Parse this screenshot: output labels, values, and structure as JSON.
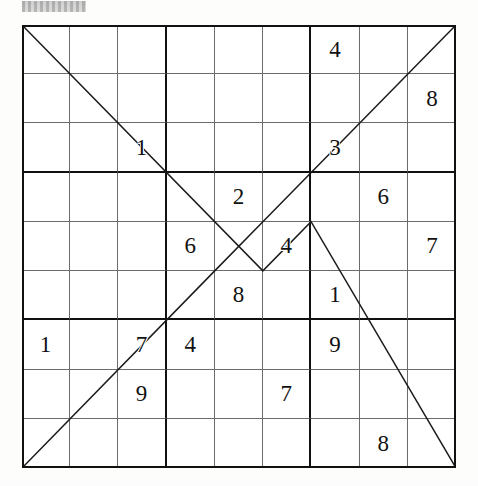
{
  "document": {
    "type": "sudoku-puzzle",
    "title": "Sudoku Puzzle Grid",
    "header_artifact": "gray-smudge",
    "grid_size": 9,
    "box_size": 3,
    "ink_color": "#111111",
    "thin_line_color": "#6b6b6b",
    "thick_line_color": "#111111",
    "background_color": "#ffffff"
  },
  "puzzle": {
    "variant": "diagonal-zigzag-sudoku",
    "row_labels": [
      "R1",
      "R2",
      "R3",
      "R4",
      "R5",
      "R6",
      "R7",
      "R8",
      "R9"
    ],
    "column_labels": [
      "C1",
      "C2",
      "C3",
      "C4",
      "C5",
      "C6",
      "C7",
      "C8",
      "C9"
    ],
    "given_count": 18,
    "empty_cell_text": "",
    "rows": [
      [
        "",
        "",
        "",
        "",
        "",
        "",
        "4",
        "",
        ""
      ],
      [
        "",
        "",
        "",
        "",
        "",
        "",
        "",
        "",
        "8"
      ],
      [
        "",
        "",
        "1",
        "",
        "",
        "",
        "3",
        "",
        ""
      ],
      [
        "",
        "",
        "",
        "",
        "2",
        "",
        "",
        "6",
        ""
      ],
      [
        "",
        "",
        "",
        "6",
        "",
        "4",
        "",
        "",
        "7"
      ],
      [
        "",
        "",
        "",
        "",
        "8",
        "",
        "1",
        "",
        ""
      ],
      [
        "1",
        "",
        "7",
        "4",
        "",
        "",
        "9",
        "",
        ""
      ],
      [
        "",
        "",
        "9",
        "",
        "",
        "7",
        "",
        "",
        ""
      ],
      [
        "",
        "",
        "",
        "",
        "",
        "",
        "",
        "8",
        ""
      ]
    ],
    "givens": [
      {
        "row": 1,
        "col": 7,
        "value": "4"
      },
      {
        "row": 2,
        "col": 9,
        "value": "8"
      },
      {
        "row": 3,
        "col": 3,
        "value": "1"
      },
      {
        "row": 3,
        "col": 7,
        "value": "3"
      },
      {
        "row": 4,
        "col": 5,
        "value": "2"
      },
      {
        "row": 4,
        "col": 8,
        "value": "6"
      },
      {
        "row": 5,
        "col": 4,
        "value": "6"
      },
      {
        "row": 5,
        "col": 6,
        "value": "4"
      },
      {
        "row": 5,
        "col": 9,
        "value": "7"
      },
      {
        "row": 6,
        "col": 5,
        "value": "8"
      },
      {
        "row": 6,
        "col": 7,
        "value": "1"
      },
      {
        "row": 7,
        "col": 1,
        "value": "1"
      },
      {
        "row": 7,
        "col": 3,
        "value": "7"
      },
      {
        "row": 7,
        "col": 4,
        "value": "4"
      },
      {
        "row": 7,
        "col": 7,
        "value": "9"
      },
      {
        "row": 8,
        "col": 3,
        "value": "9"
      },
      {
        "row": 8,
        "col": 6,
        "value": "7"
      },
      {
        "row": 9,
        "col": 8,
        "value": "8"
      }
    ]
  },
  "diagonals": {
    "description": "Two bouncing diagonal paths drawn across the grid forming crossing X shapes",
    "stroke_color": "#1b1b1b",
    "stroke_width": 1.5,
    "paths": [
      {
        "name": "descending-bouncing-diagonal",
        "points_percent": [
          [
            0,
            0
          ],
          [
            55.5,
            55.5
          ],
          [
            66.6,
            44.4
          ],
          [
            100,
            100
          ]
        ]
      },
      {
        "name": "ascending-bouncing-diagonal",
        "points_percent": [
          [
            0,
            100
          ],
          [
            44.4,
            55.5
          ],
          [
            55.5,
            44.4
          ],
          [
            100,
            0
          ]
        ]
      }
    ]
  }
}
